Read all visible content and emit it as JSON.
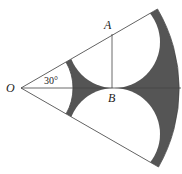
{
  "diagram": {
    "labels": {
      "O": "O",
      "A": "A",
      "B": "B",
      "angle": "30°"
    },
    "colors": {
      "shade": "#555555",
      "line": "#444444",
      "background": "#ffffff"
    }
  }
}
